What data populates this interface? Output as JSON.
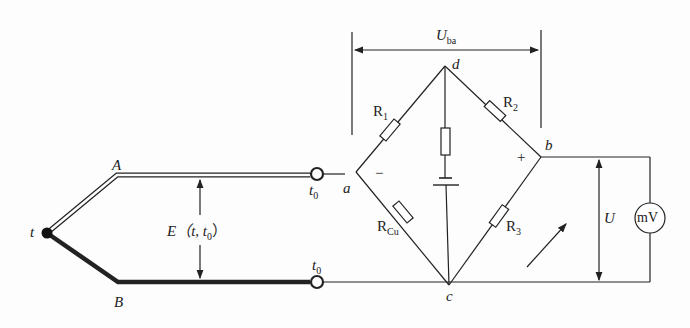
{
  "diagram": {
    "type": "thermocouple cold-junction compensation bridge circuit",
    "labels": {
      "hot_junction": "t",
      "wire_a": "A",
      "wire_b": "B",
      "terminal_top_temp": "t",
      "terminal_top_temp_sub": "0",
      "terminal_bottom_temp": "t",
      "terminal_bottom_temp_sub": "0",
      "emf_main": "E（t, t",
      "emf_sub": "0",
      "emf_close": "）",
      "node_a": "a",
      "node_b": "b",
      "node_c": "c",
      "node_d": "d",
      "r1_main": "R",
      "r1_sub": "1",
      "r2_main": "R",
      "r2_sub": "2",
      "r3_main": "R",
      "r3_sub": "3",
      "rcu_main": "R",
      "rcu_sub": "Cu",
      "minus_sign": "−",
      "plus_sign": "+",
      "uba_main": "U",
      "uba_sub": "ba",
      "u_label": "U",
      "meter_label": "mV"
    },
    "colors": {
      "line": "#222222",
      "background": "#fdfdfd"
    }
  }
}
